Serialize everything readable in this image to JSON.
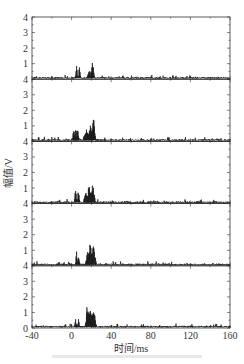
{
  "chart_data": {
    "type": "line",
    "layout": "5 vertically stacked panels sharing x axis",
    "xlabel": "时间/ms",
    "ylabel": "幅值/V",
    "xlim": [
      -40,
      160
    ],
    "xticks": [
      -40,
      0,
      40,
      80,
      120,
      160
    ],
    "ylim_per_panel": [
      0,
      4
    ],
    "yticks_per_panel": [
      0,
      1,
      2,
      3,
      4
    ],
    "ytick_labels_shared_boundary": "4",
    "bottom_panel_zero_label": "0",
    "grid": false,
    "line_color": "#1a1a1a",
    "baseline_noise_amplitude": 0.15,
    "panels": [
      {
        "index": 1,
        "bursts": [
          {
            "t": 5,
            "peak": 0.9,
            "width": 1
          },
          {
            "t": 8,
            "peak": 1.0,
            "width": 1
          },
          {
            "t": 18,
            "peak": 0.55,
            "width": 3
          },
          {
            "t": 21,
            "peak": 1.25,
            "width": 2
          }
        ]
      },
      {
        "index": 2,
        "bursts": [
          {
            "t": 2,
            "peak": 1.0,
            "width": 1
          },
          {
            "t": 4,
            "peak": 1.1,
            "width": 1
          },
          {
            "t": 6,
            "peak": 1.1,
            "width": 1
          },
          {
            "t": 15,
            "peak": 0.8,
            "width": 4
          },
          {
            "t": 19,
            "peak": 1.05,
            "width": 3
          },
          {
            "t": 22,
            "peak": 1.7,
            "width": 2
          }
        ]
      },
      {
        "index": 3,
        "bursts": [
          {
            "t": 4,
            "peak": 1.2,
            "width": 1
          },
          {
            "t": 7,
            "peak": 1.1,
            "width": 1
          },
          {
            "t": 14,
            "peak": 1.0,
            "width": 2
          },
          {
            "t": 18,
            "peak": 1.45,
            "width": 3
          },
          {
            "t": 21,
            "peak": 1.45,
            "width": 3
          }
        ]
      },
      {
        "index": 4,
        "bursts": [
          {
            "t": 5,
            "peak": 1.0,
            "width": 1
          },
          {
            "t": 7,
            "peak": 0.8,
            "width": 1
          },
          {
            "t": 16,
            "peak": 1.1,
            "width": 2
          },
          {
            "t": 19,
            "peak": 1.55,
            "width": 4
          },
          {
            "t": 22,
            "peak": 1.35,
            "width": 3
          }
        ]
      },
      {
        "index": 5,
        "bursts": [
          {
            "t": 4,
            "peak": 0.6,
            "width": 1
          },
          {
            "t": 7,
            "peak": 0.6,
            "width": 1
          },
          {
            "t": 16,
            "peak": 1.7,
            "width": 2
          },
          {
            "t": 19,
            "peak": 1.6,
            "width": 4
          },
          {
            "t": 22,
            "peak": 1.4,
            "width": 3
          }
        ]
      }
    ]
  },
  "axis": {
    "x_title": "时间/ms",
    "y_title": "幅值/V"
  }
}
